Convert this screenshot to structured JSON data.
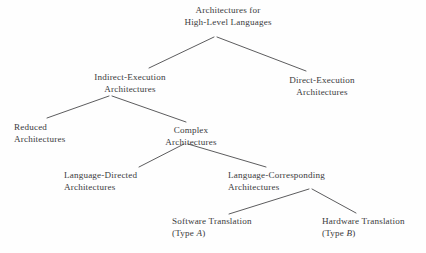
{
  "diagram": {
    "type": "tree",
    "line_color": "#4a4a4c",
    "text_color": "#3a3a3c",
    "background_color": "#fefefe",
    "nodes": {
      "root": {
        "line1": "Architectures for",
        "line2": "High-Level Languages"
      },
      "indirect": {
        "line1": "Indirect-Execution",
        "line2": "Architectures"
      },
      "direct": {
        "line1": "Direct-Execution",
        "line2": "Architectures"
      },
      "reduced": {
        "line1": "Reduced",
        "line2": "Architectures"
      },
      "complex": {
        "line1": "Complex",
        "line2": "Architectures"
      },
      "language_directed": {
        "line1": "Language-Directed",
        "line2": "Architectures"
      },
      "language_corresponding": {
        "line1": "Language-Corresponding",
        "line2": "Architectures"
      },
      "software_translation": {
        "line1": "Software Translation",
        "line2_prefix": "(Type ",
        "line2_italic": "A",
        "line2_suffix": ")"
      },
      "hardware_translation": {
        "line1": "Hardware Translation",
        "line2_prefix": "(Type ",
        "line2_italic": "B",
        "line2_suffix": ")"
      }
    }
  }
}
